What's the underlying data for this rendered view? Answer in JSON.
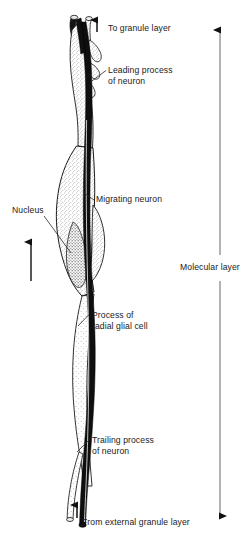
{
  "figure": {
    "background_color": "#ffffff",
    "ink_color": "#1a1a1a",
    "width": 247,
    "height": 553
  },
  "labels": {
    "to_granule_layer": "To granule layer",
    "leading_process_line1": "Leading process",
    "leading_process_line2": "of neuron",
    "migrating_neuron": "Migrating neuron",
    "nucleus": "Nucleus",
    "process_radial_glial_line1": "Process of",
    "process_radial_glial_line2": "radial glial cell",
    "trailing_process_line1": "Trailing process",
    "trailing_process_line2": "of neuron",
    "from_external_granule_layer": "From external granule layer",
    "molecular_layer": "Molecular layer"
  },
  "arrows": {
    "top_migration_arrow": "up-arrow-icon",
    "left_migration_arrow": "up-arrow-icon",
    "bottom_migration_arrow": "up-arrow-icon",
    "molecular_layer_extent": "double-headed-vertical-arrow-icon"
  },
  "structures": {
    "neuron_soma": "migrating-neuron-soma",
    "neuron_nucleus": "neuron-nucleus",
    "radial_glial_fiber": "radial-glial-cell-process",
    "leading_process": "leading-process-of-neuron",
    "trailing_process": "trailing-process-of-neuron"
  }
}
